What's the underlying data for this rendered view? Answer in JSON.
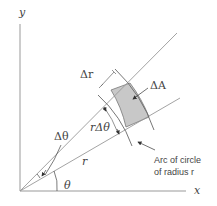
{
  "diagram": {
    "axes": {
      "x_label": "x",
      "y_label": "y"
    },
    "labels": {
      "delta_r": "Δr",
      "delta_A": "ΔA",
      "r_delta_theta": "rΔθ",
      "delta_theta": "Δθ",
      "r": "r",
      "theta": "θ",
      "arc_line1": "Arc of circle",
      "arc_line2": "of radius r"
    },
    "colors": {
      "line": "#888888",
      "shade": "#c8c8c8",
      "text": "#444444"
    }
  }
}
